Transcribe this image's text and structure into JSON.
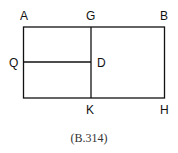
{
  "diagram": {
    "labels": {
      "A": "A",
      "G": "G",
      "B": "B",
      "Q": "Q",
      "D": "D",
      "K": "K",
      "H": "H"
    },
    "caption": "(B.314)",
    "stroke_color": "#111111"
  }
}
